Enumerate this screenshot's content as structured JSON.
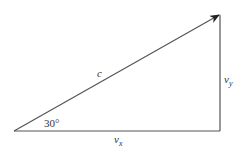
{
  "diagram": {
    "hypotenuse_label": "c",
    "vertical_label": "v",
    "vertical_sub": "y",
    "horizontal_label": "v",
    "horizontal_sub": "x",
    "angle_label": "30°",
    "line_color": "#444444"
  }
}
